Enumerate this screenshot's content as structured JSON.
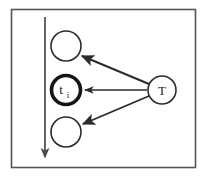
{
  "figure": {
    "background_color": "#ffffff",
    "stroke_color": "#2b2b2b",
    "border": {
      "name": "figure-border",
      "x": 11.5,
      "y": 9.5,
      "width": 184,
      "height": 158,
      "stroke_width": 1.6,
      "color": "#555555"
    },
    "timeline_arrow": {
      "name": "time-axis-arrow",
      "label": "",
      "x": 45,
      "y_start": 17,
      "y_end": 158,
      "stroke_width": 1.7,
      "color": "#4a4a4a",
      "direction": "down"
    },
    "nodes": [
      {
        "id": "node-top",
        "label": "",
        "sub": "",
        "cx": 66,
        "cy": 46,
        "r": 15,
        "stroke_width": 1.6,
        "emphasis": false
      },
      {
        "id": "node-ti",
        "label": "t",
        "sub": "i",
        "cx": 66,
        "cy": 90,
        "r": 15,
        "stroke_width": 3.6,
        "emphasis": true
      },
      {
        "id": "node-bottom",
        "label": "",
        "sub": "",
        "cx": 66,
        "cy": 132,
        "r": 15,
        "stroke_width": 1.6,
        "emphasis": false
      },
      {
        "id": "node-T",
        "label": "T",
        "sub": "",
        "cx": 162,
        "cy": 90,
        "r": 14,
        "stroke_width": 1.6,
        "emphasis": false
      }
    ],
    "edges": [
      {
        "id": "edge-T-to-top",
        "from": "node-T",
        "to": "node-top",
        "x1": 149,
        "y1": 84,
        "x2": 81,
        "y2": 56,
        "stroke_width": 1.9
      },
      {
        "id": "edge-T-to-ti",
        "from": "node-T",
        "to": "node-ti",
        "x1": 147,
        "y1": 90,
        "x2": 84,
        "y2": 90,
        "stroke_width": 1.6
      },
      {
        "id": "edge-T-to-bottom",
        "from": "node-T",
        "to": "node-bottom",
        "x1": 149,
        "y1": 96,
        "x2": 82,
        "y2": 124,
        "stroke_width": 1.9
      }
    ]
  }
}
